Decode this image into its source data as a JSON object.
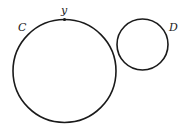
{
  "diagram": {
    "circles": [
      {
        "label": "C",
        "cx": 64.5,
        "cy": 71,
        "r": 51.5
      },
      {
        "label": "D",
        "cx": 142.5,
        "cy": 44.5,
        "r": 25.5
      }
    ],
    "point": {
      "label": "y",
      "x": 64.5,
      "y": 19.5
    },
    "stroke_color": "#1a1a1a"
  }
}
